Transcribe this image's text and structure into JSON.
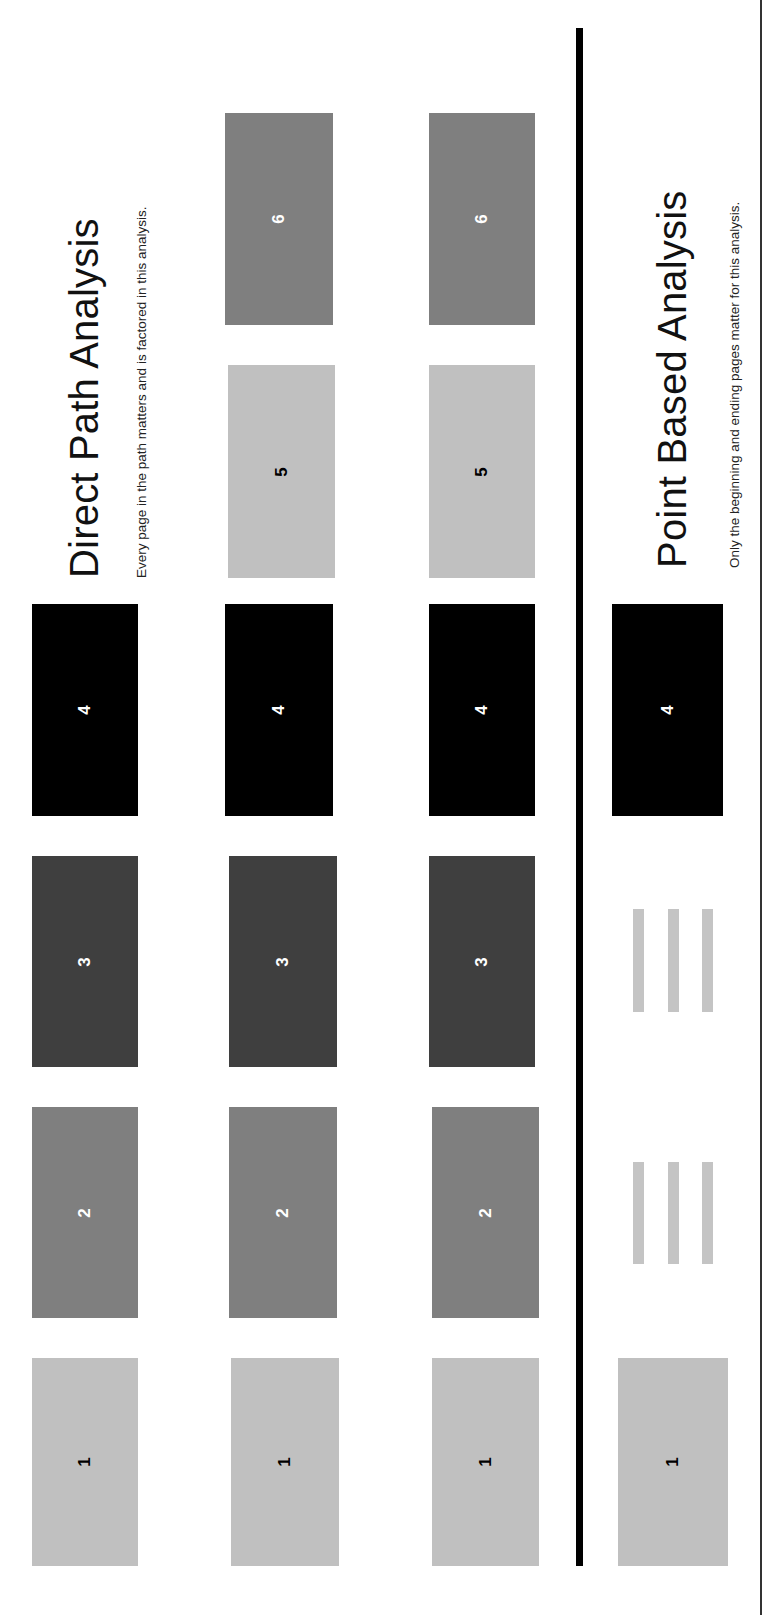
{
  "colors": {
    "page_1": "#c0c0c0",
    "page_2": "#7f7f7f",
    "page_3": "#3f3f3f",
    "page_4": "#000000",
    "page_5": "#c0c0c0",
    "page_6": "#7f7f7f",
    "label_dark": "#000000",
    "label_light": "#ffffff",
    "placeholder_bar": "#c4c4c4",
    "divider": "#000000"
  },
  "direct_path": {
    "title": "Direct Path Analysis",
    "subtitle": "Every page in the path matters and is factored in this analysis.",
    "rows": [
      {
        "pages": [
          "1",
          "2",
          "3",
          "4"
        ]
      },
      {
        "pages": [
          "1",
          "2",
          "3",
          "4",
          "5",
          "6"
        ]
      },
      {
        "pages": [
          "1",
          "2",
          "3",
          "4",
          "5",
          "6"
        ]
      }
    ]
  },
  "point_based": {
    "title": "Point Based Analysis",
    "subtitle": "Only the beginning and ending pages matter for this analysis.",
    "pages": [
      "1",
      "4"
    ],
    "skipped_placeholders": 2
  }
}
